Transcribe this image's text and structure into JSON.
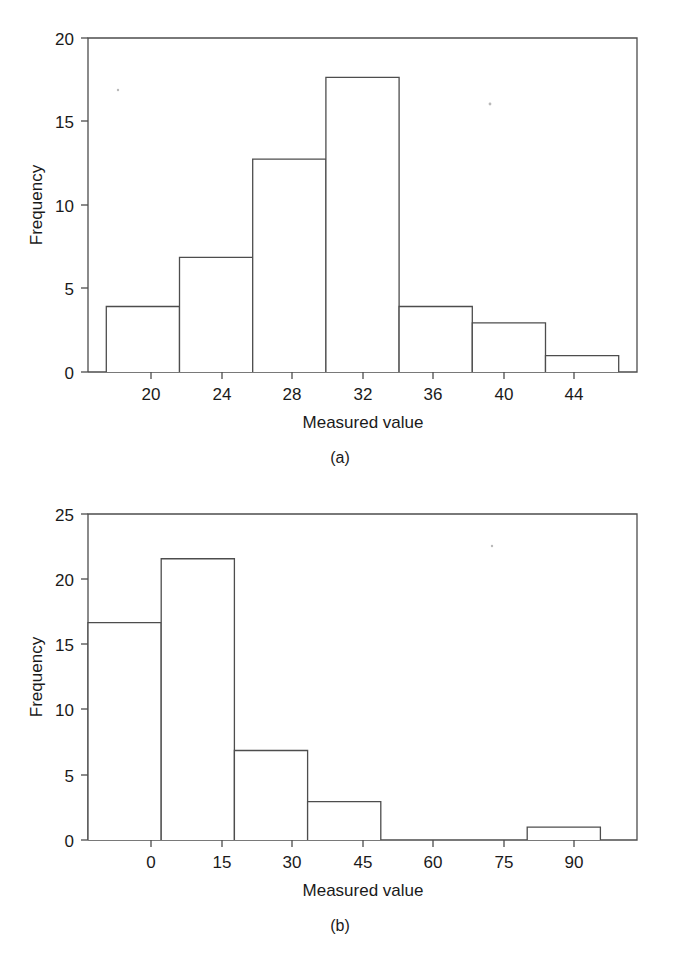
{
  "figure": {
    "panels": [
      {
        "id": "a",
        "caption": "(a)",
        "xlabel": "Measured value",
        "ylabel": "Frequency"
      },
      {
        "id": "b",
        "caption": "(b)",
        "xlabel": "Measured value",
        "ylabel": "Frequency"
      }
    ]
  },
  "chart_data": [
    {
      "type": "bar",
      "panel": "(a)",
      "title": "",
      "xlabel": "Measured value",
      "ylabel": "Frequency",
      "grid": false,
      "legend": "none",
      "xlim": [
        17,
        47
      ],
      "ylim": [
        0,
        20.4
      ],
      "xticks": [
        20,
        24,
        28,
        32,
        36,
        40,
        44
      ],
      "xtick_labels": [
        "20",
        "24",
        "28",
        "32",
        "36",
        "40",
        "44"
      ],
      "yticks": [
        0,
        5,
        10,
        15,
        20
      ],
      "ytick_labels": [
        "0",
        "5",
        "10",
        "15",
        "20"
      ],
      "bin_edges": [
        18,
        22,
        26,
        30,
        34,
        38,
        42,
        46
      ],
      "categories": [
        "18-22",
        "22-26",
        "26-30",
        "30-34",
        "34-38",
        "38-42",
        "42-46"
      ],
      "values": [
        4,
        7,
        13,
        18,
        4,
        3,
        1
      ]
    },
    {
      "type": "bar",
      "panel": "(b)",
      "title": "",
      "xlabel": "Measured value",
      "ylabel": "Frequency",
      "grid": false,
      "legend": "none",
      "xlim": [
        -7.5,
        105
      ],
      "ylim": [
        0,
        25.5
      ],
      "xticks": [
        0,
        15,
        30,
        45,
        60,
        75,
        90
      ],
      "xtick_labels": [
        "0",
        "15",
        "30",
        "45",
        "60",
        "75",
        "90"
      ],
      "yticks": [
        0,
        5,
        10,
        15,
        20,
        25
      ],
      "ytick_labels": [
        "0",
        "5",
        "10",
        "15",
        "20",
        "25"
      ],
      "bin_edges": [
        -7.5,
        7.5,
        22.5,
        37.5,
        52.5,
        67.5,
        82.5,
        97.5
      ],
      "categories": [
        "-7.5-7.5",
        "7.5-22.5",
        "22.5-37.5",
        "37.5-52.5",
        "52.5-67.5",
        "67.5-82.5",
        "82.5-97.5"
      ],
      "values": [
        17,
        22,
        7,
        3,
        0,
        0,
        1
      ]
    }
  ]
}
